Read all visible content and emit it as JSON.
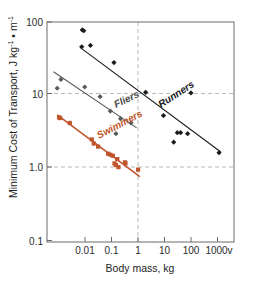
{
  "chart_data": {
    "type": "scatter",
    "title": "",
    "xlabel": "Body mass, kg",
    "ylabel": "Minimum Cost of Transport, J kg⁻¹ • m⁻¹",
    "ylabel_parts": {
      "lead": "Minimum Cost of Transport, J kg",
      "exp1": "-1",
      "mid": " • m",
      "exp2": "-1"
    },
    "xscale": "log",
    "yscale": "log",
    "xlim": [
      0.002,
      1600
    ],
    "ylim": [
      0.1,
      100
    ],
    "xticks": [
      0.01,
      0.1,
      1,
      10,
      100,
      1000
    ],
    "xtick_labels": [
      "0.01",
      "0.1",
      "1",
      "10",
      "100",
      "1000v"
    ],
    "yticks": [
      0.1,
      1.0,
      10,
      100
    ],
    "ytick_labels": [
      "0.1",
      "1.0",
      "10",
      "100"
    ],
    "grid": {
      "enabled": true,
      "style": "dashed",
      "color": "#b9b9b9",
      "horizontal_at": [
        1.0,
        10
      ],
      "vertical_at": [
        1
      ]
    },
    "legend": {
      "position": "inline-annotations",
      "entries": [
        {
          "name": "Runners",
          "color": "#1b1b1b"
        },
        {
          "name": "Fliers",
          "color": "#5a5a5a"
        },
        {
          "name": "Swimmers",
          "color": "#c0552b"
        }
      ]
    },
    "series": [
      {
        "name": "Runners",
        "color": "#1b1b1b",
        "marker": "diamond",
        "label_text": "Runners",
        "label_rotation": -33,
        "fit_line": {
          "x1": 0.022,
          "y1": 45.0,
          "x2": 600,
          "y2": 1.7
        },
        "points": [
          {
            "x": 0.026,
            "y": 78
          },
          {
            "x": 0.029,
            "y": 76
          },
          {
            "x": 0.025,
            "y": 46
          },
          {
            "x": 0.047,
            "y": 48
          },
          {
            "x": 0.26,
            "y": 28
          },
          {
            "x": 2.6,
            "y": 11
          },
          {
            "x": 70,
            "y": 10.8
          },
          {
            "x": 9.5,
            "y": 5.3
          },
          {
            "x": 26,
            "y": 3.1
          },
          {
            "x": 33,
            "y": 3.1
          },
          {
            "x": 55,
            "y": 3.0
          },
          {
            "x": 20,
            "y": 2.3
          },
          {
            "x": 540,
            "y": 1.65
          }
        ]
      },
      {
        "name": "Fliers",
        "color": "#5a5a5a",
        "marker": "diamond",
        "label_text": "Fliers",
        "label_rotation": -26,
        "fit_line": {
          "x1": 0.0032,
          "y1": 21.0,
          "x2": 1.35,
          "y2": 3.6
        },
        "points": [
          {
            "x": 0.0055,
            "y": 16.5
          },
          {
            "x": 0.0042,
            "y": 12.5
          },
          {
            "x": 0.031,
            "y": 13.0
          },
          {
            "x": 0.095,
            "y": 9.6
          },
          {
            "x": 0.2,
            "y": 6.1
          },
          {
            "x": 0.42,
            "y": 4.8
          },
          {
            "x": 0.9,
            "y": 4.2
          },
          {
            "x": 0.3,
            "y": 3.0
          }
        ]
      },
      {
        "name": "Swimmers",
        "color": "#c0552b",
        "marker": "square",
        "label_text": "Swimmers",
        "label_rotation": -28,
        "fit_line": {
          "x1": 0.0042,
          "y1": 5.4,
          "x2": 1.7,
          "y2": 0.78
        },
        "points": [
          {
            "x": 0.0048,
            "y": 5.0
          },
          {
            "x": 0.0052,
            "y": 4.9
          },
          {
            "x": 0.0105,
            "y": 4.2
          },
          {
            "x": 0.052,
            "y": 2.5
          },
          {
            "x": 0.06,
            "y": 2.2
          },
          {
            "x": 0.082,
            "y": 2.0
          },
          {
            "x": 0.17,
            "y": 1.6
          },
          {
            "x": 0.2,
            "y": 1.55
          },
          {
            "x": 0.24,
            "y": 1.5
          },
          {
            "x": 0.27,
            "y": 1.18
          },
          {
            "x": 0.3,
            "y": 1.12
          },
          {
            "x": 0.33,
            "y": 1.35
          },
          {
            "x": 0.36,
            "y": 1.05
          },
          {
            "x": 0.58,
            "y": 1.22
          },
          {
            "x": 0.6,
            "y": 1.18
          },
          {
            "x": 1.5,
            "y": 0.97
          }
        ]
      }
    ]
  }
}
